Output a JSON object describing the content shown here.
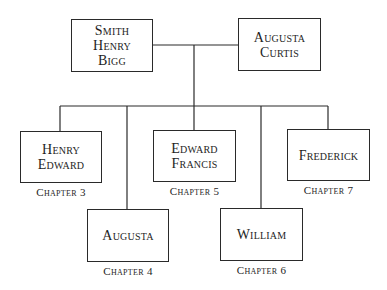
{
  "diagram": {
    "type": "family-tree",
    "line_color": "#2a2a2a",
    "parents": [
      {
        "id": "smith-henry-bigg",
        "name_lines": [
          "Smith",
          "Henry",
          "Bigg"
        ]
      },
      {
        "id": "augusta-curtis",
        "name_lines": [
          "Augusta",
          "Curtis"
        ]
      }
    ],
    "children": [
      {
        "id": "henry-edward",
        "name_lines": [
          "Henry",
          "Edward"
        ],
        "chapter": "Chapter 3"
      },
      {
        "id": "augusta",
        "name_lines": [
          "Augusta"
        ],
        "chapter": "Chapter 4"
      },
      {
        "id": "edward-francis",
        "name_lines": [
          "Edward",
          "Francis"
        ],
        "chapter": "Chapter 5"
      },
      {
        "id": "william",
        "name_lines": [
          "William"
        ],
        "chapter": "Chapter 6"
      },
      {
        "id": "frederick",
        "name_lines": [
          "Frederick"
        ],
        "chapter": "Chapter 7"
      }
    ]
  }
}
